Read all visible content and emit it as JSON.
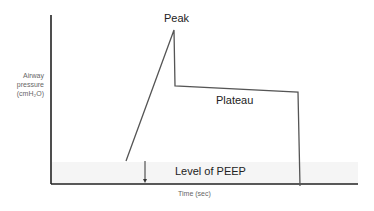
{
  "diagram": {
    "labels": {
      "peak": "Peak",
      "plateau": "Plateau",
      "peep": "Level of PEEP"
    },
    "axes": {
      "y_label_line1": "Airway",
      "y_label_line2": "pressure",
      "y_label_line3": "(cmH₂O)",
      "x_label": "Time (sec)"
    },
    "colors": {
      "axis": "#222222",
      "trace": "#555555",
      "peep_band": "#f3f3f3"
    }
  }
}
